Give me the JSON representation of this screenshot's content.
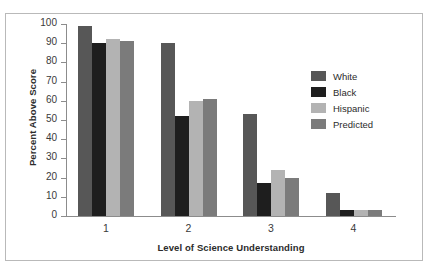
{
  "chart_data": {
    "type": "bar",
    "title": "",
    "xlabel": "Level of Science Understanding",
    "ylabel": "Percent Above Score",
    "categories": [
      "1",
      "2",
      "3",
      "4"
    ],
    "ylim": [
      0,
      100
    ],
    "yticks": [
      0,
      10,
      20,
      30,
      40,
      50,
      60,
      70,
      80,
      90,
      100
    ],
    "grid": false,
    "legend_position": "upper-right",
    "series": [
      {
        "name": "White",
        "color": "#575757",
        "values": [
          99,
          90,
          53,
          12
        ]
      },
      {
        "name": "Black",
        "color": "#1e1e1e",
        "values": [
          90,
          52,
          17,
          3
        ]
      },
      {
        "name": "Hispanic",
        "color": "#b3b3b3",
        "values": [
          92,
          60,
          24,
          3
        ]
      },
      {
        "name": "Predicted",
        "color": "#7b7b7b",
        "values": [
          91,
          61,
          20,
          3
        ]
      }
    ]
  },
  "frame": {
    "border_color": "#b9b9b9",
    "background": "#ffffff"
  },
  "axis": {
    "line_color": "#8c8c8c",
    "tick_color": "#8c8c8c"
  }
}
